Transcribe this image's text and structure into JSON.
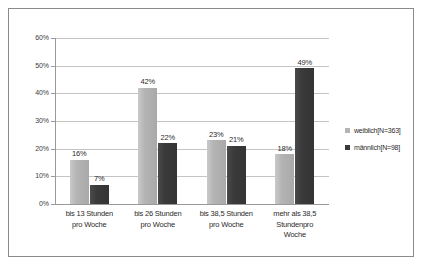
{
  "chart_data": {
    "type": "bar",
    "title": "",
    "subtitle": "",
    "xlabel": "",
    "ylabel": "",
    "ylim": [
      0,
      60
    ],
    "ytick_labels": [
      "0%",
      "10%",
      "20%",
      "30%",
      "40%",
      "50%",
      "60%"
    ],
    "ytick_values": [
      0,
      10,
      20,
      30,
      40,
      50,
      60
    ],
    "grid": true,
    "legend_position": "right",
    "categories": [
      "bis 13 Stunden pro Woche",
      "bis 26 Stunden pro Woche",
      "bis 38,5 Stunden pro Woche",
      "mehr als 38,5 Stundenpro Woche"
    ],
    "category_lines": [
      [
        "bis 13 Stunden",
        "pro Woche"
      ],
      [
        "bis 26 Stunden",
        "pro Woche"
      ],
      [
        "bis 38,5 Stunden",
        "pro Woche"
      ],
      [
        "mehr als 38,5",
        "Stundenpro",
        "Woche"
      ]
    ],
    "series": [
      {
        "name": "weiblich[N=363]",
        "color": "#b4b4b4",
        "values": [
          16,
          42,
          23,
          18
        ],
        "data_labels": [
          "16%",
          "42%",
          "23%",
          "18%"
        ]
      },
      {
        "name": "männlich[N=98]",
        "color": "#3a3a3a",
        "values": [
          7,
          22,
          21,
          49
        ],
        "data_labels": [
          "7%",
          "22%",
          "21%",
          "49%"
        ]
      }
    ]
  },
  "legend": {
    "items": [
      {
        "label": "weiblich[N=363]",
        "swatch": "legend-swatch-weiblich"
      },
      {
        "label": "männlich[N=98]",
        "swatch": "legend-swatch-maennlich"
      }
    ]
  },
  "axis": {
    "y_labels": [
      "60%",
      "50%",
      "40%",
      "30%",
      "20%",
      "10%",
      "0%"
    ]
  }
}
